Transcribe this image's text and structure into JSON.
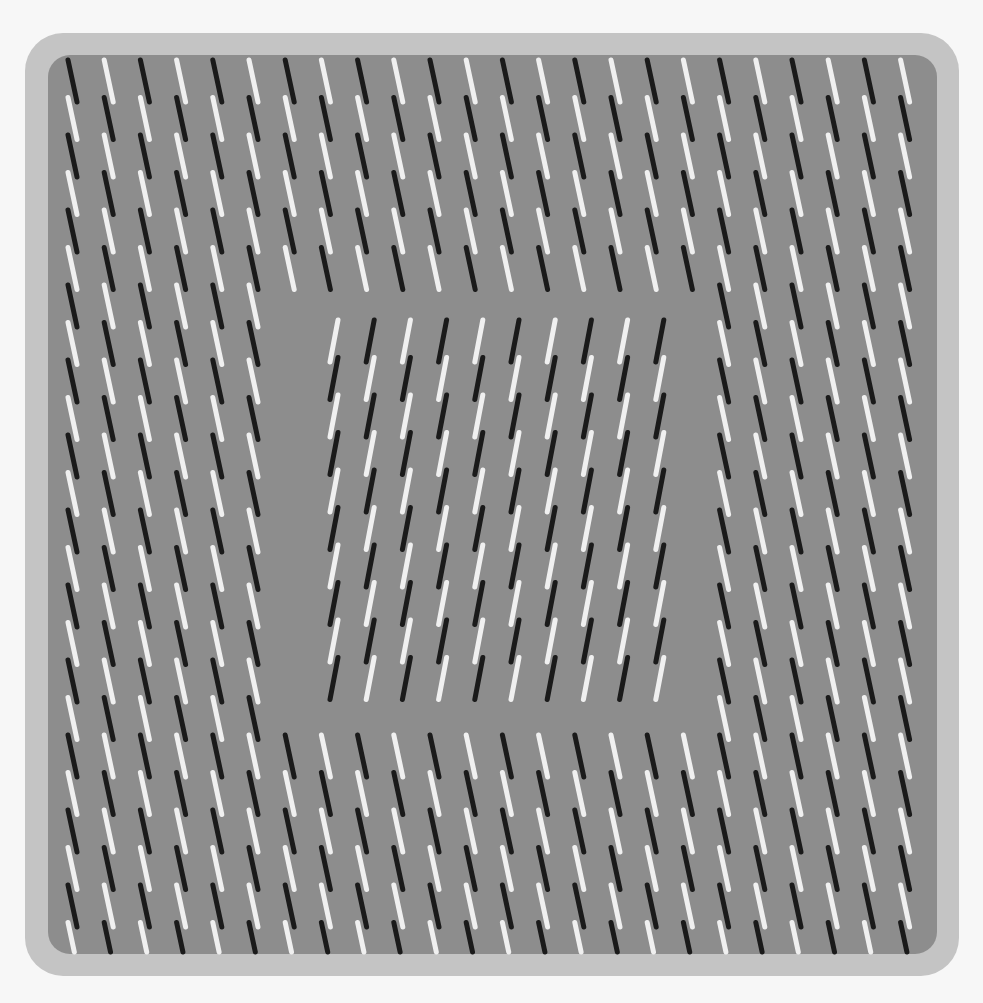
{
  "colors": {
    "page_background": "#f7f7f7",
    "frame": "#c4c4c4",
    "field": "#8d8d8d",
    "dash_dark": "#1a1a1a",
    "dash_light": "#f0f0f0"
  },
  "outer_pattern": {
    "orientation": "backslash",
    "columns_x": [
      68,
      104,
      140,
      176,
      212,
      248,
      285,
      321,
      357,
      393,
      429,
      465,
      501,
      537,
      573,
      609,
      645,
      681,
      717,
      753,
      789,
      825,
      861,
      897,
      909
    ],
    "column_count": 24,
    "first_x": 68,
    "column_pitch": 36.2,
    "first_y": 60,
    "dash_pitch_y": 37.5,
    "dash_length": 42,
    "dash_slant_x": 9,
    "first_column_starts": "dark",
    "bottom_y": 950
  },
  "gap_region": {
    "x1": 272,
    "y1": 298,
    "x2": 712,
    "y2": 728
  },
  "inner_pattern": {
    "orientation": "slash",
    "column_count": 10,
    "first_x": 330,
    "column_pitch": 36.2,
    "first_y": 320,
    "dash_pitch_y": 37.5,
    "dash_length": 42,
    "dash_slant_x": -8,
    "rows": 10,
    "first_column_starts": "light"
  },
  "frame": {
    "x": 25,
    "y": 33,
    "width": 934,
    "height": 943
  },
  "field": {
    "x": 48,
    "y": 55,
    "width": 889,
    "height": 899
  }
}
